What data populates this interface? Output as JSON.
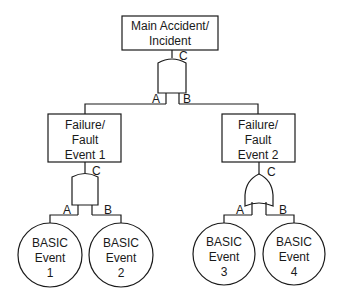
{
  "diagram": {
    "type": "fault-tree",
    "top_event": {
      "line1": "Main Accident/",
      "line2": "Incident",
      "gate": "AND",
      "output_label": "C",
      "input_labels": [
        "A",
        "B"
      ]
    },
    "intermediate_events": [
      {
        "line1": "Failure/",
        "line2": "Fault",
        "line3": "Event 1",
        "gate": "AND",
        "output_label": "C",
        "input_labels": [
          "A",
          "B"
        ]
      },
      {
        "line1": "Failure/",
        "line2": "Fault",
        "line3": "Event 2",
        "gate": "OR",
        "output_label": "C",
        "input_labels": [
          "A",
          "B"
        ]
      }
    ],
    "basic_events": [
      {
        "line1": "BASIC",
        "line2": "Event",
        "line3": "1"
      },
      {
        "line1": "BASIC",
        "line2": "Event",
        "line3": "2"
      },
      {
        "line1": "BASIC",
        "line2": "Event",
        "line3": "3"
      },
      {
        "line1": "BASIC",
        "line2": "Event",
        "line3": "4"
      }
    ],
    "colors": {
      "stroke": "#1a1a1a",
      "background": "#ffffff"
    }
  }
}
